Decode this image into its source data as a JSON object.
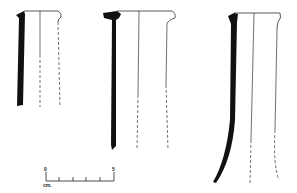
{
  "figure": {
    "type": "pottery profile drawing",
    "vessels": [
      {
        "id": 1,
        "description": "short cylindrical vessel section, thickened rim, dashed exterior"
      },
      {
        "id": 2,
        "description": "medium cylindrical vessel section, flared rim"
      },
      {
        "id": 3,
        "description": "tall vessel section, tapering and curving at base"
      }
    ],
    "colors": {
      "ink": "#111111",
      "background": "#ffffff"
    }
  },
  "scale_bar": {
    "start_label": "0",
    "end_label": "5",
    "unit_label": "cm.",
    "ticks": 6
  }
}
